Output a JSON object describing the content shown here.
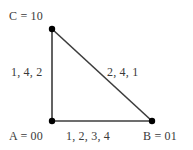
{
  "diagram": {
    "type": "triangle-network-graph",
    "colors": {
      "background": "#ffffff",
      "edge": "#3c3c3c",
      "node": "#000000",
      "text": "#3a3a3a"
    },
    "nodes": [
      {
        "id": "C",
        "label": "C = 10",
        "x": 52,
        "y": 29
      },
      {
        "id": "A",
        "label": "A = 00",
        "x": 52,
        "y": 121
      },
      {
        "id": "B",
        "label": "B = 01",
        "x": 152,
        "y": 121
      }
    ],
    "edges": [
      {
        "id": "AC",
        "from": "A",
        "to": "C",
        "label": "1, 4, 2"
      },
      {
        "id": "CB",
        "from": "C",
        "to": "B",
        "label": "2, 4, 1"
      },
      {
        "id": "AB",
        "from": "A",
        "to": "B",
        "label": "1, 2, 3, 4"
      }
    ]
  }
}
